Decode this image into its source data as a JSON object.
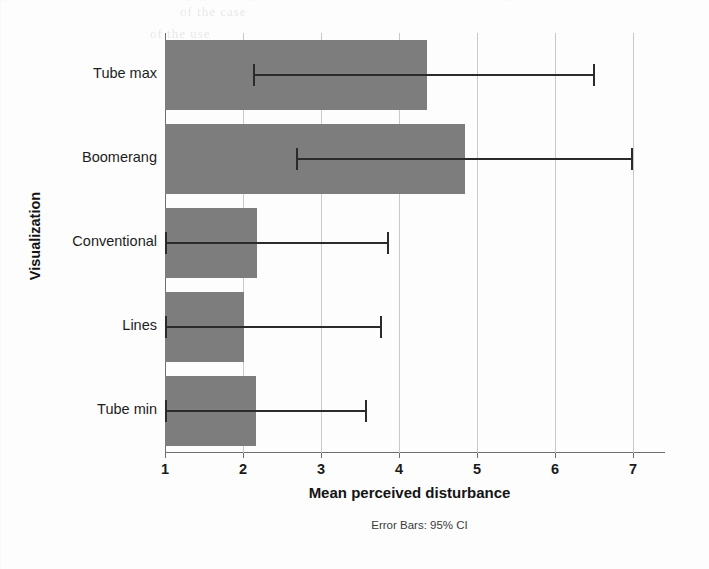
{
  "chart_data": {
    "type": "bar",
    "orientation": "horizontal",
    "title": "",
    "xlabel": "Mean perceived disturbance",
    "ylabel": "Visualization",
    "caption": "Error Bars: 95% CI",
    "categories": [
      "Tube max",
      "Boomerang",
      "Conventional",
      "Lines",
      "Tube min"
    ],
    "values": [
      4.36,
      4.85,
      2.18,
      2.01,
      2.17
    ],
    "error_low": [
      2.13,
      2.68,
      1.0,
      1.0,
      1.0
    ],
    "error_high": [
      6.49,
      6.97,
      3.85,
      3.76,
      3.56
    ],
    "xlim": [
      1,
      7
    ],
    "xticks": [
      1,
      2,
      3,
      4,
      5,
      6,
      7
    ],
    "xtick_labels": [
      "1",
      "2",
      "3",
      "4",
      "5",
      "6",
      "7"
    ],
    "grid": true,
    "legend": "none",
    "bar_color": "#7d7d7d",
    "error_color": "#2b2b2b",
    "grid_color": "#c9c9c9",
    "axis_color": "#6e6e6e"
  },
  "ghost_text": {
    "line1": "of the case",
    "line2": "of the use"
  }
}
